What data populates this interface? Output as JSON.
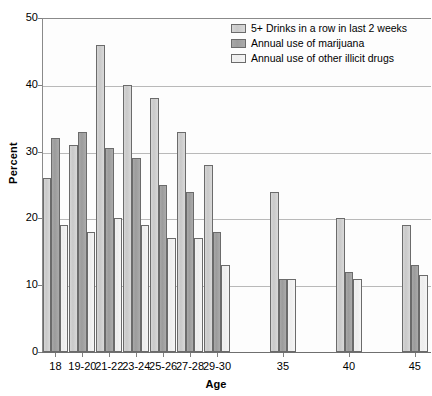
{
  "chart_data": {
    "type": "bar",
    "title": "",
    "xlabel": "Age",
    "ylabel": "Percent",
    "ylim": [
      0,
      50
    ],
    "yticks": [
      0,
      10,
      20,
      30,
      40,
      50
    ],
    "grid": true,
    "legend_position": "top-right",
    "categories": [
      "18",
      "19-20",
      "21-22",
      "23-24",
      "25-26",
      "27-28",
      "29-30",
      "35",
      "40",
      "45"
    ],
    "series": [
      {
        "name": "5+ Drinks in a row in last 2 weeks",
        "color": "#d2d2d2",
        "values": [
          26,
          31,
          46,
          40,
          38,
          33,
          28,
          24,
          20,
          19
        ]
      },
      {
        "name": "Annual use of marijuana",
        "color": "#a2a2a2",
        "values": [
          32,
          33,
          30.5,
          29,
          25,
          24,
          18,
          11,
          12,
          13
        ]
      },
      {
        "name": "Annual use of other illicit drugs",
        "color": "#f0f0f0",
        "values": [
          19,
          18,
          20,
          19,
          17,
          17,
          13,
          11,
          11,
          11.5
        ]
      }
    ]
  },
  "axes": {
    "y_title": "Percent",
    "x_title": "Age",
    "y_tick_labels": [
      "50",
      "40",
      "30",
      "20",
      "10",
      "0"
    ],
    "x_tick_labels": [
      "18",
      "19-20",
      "21-22",
      "23-24",
      "25-26",
      "27-28",
      "29-30",
      "35",
      "40",
      "45"
    ]
  },
  "legend": {
    "items": [
      {
        "label": "5+ Drinks in a row in last 2 weeks",
        "swatch": "#d2d2d2"
      },
      {
        "label": "Annual use of marijuana",
        "swatch": "#a2a2a2"
      },
      {
        "label": "Annual use of other illicit drugs",
        "swatch": "#f0f0f0"
      }
    ]
  }
}
